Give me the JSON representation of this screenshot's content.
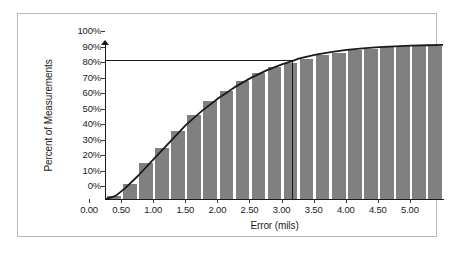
{
  "figure": {
    "background": "#ffffff",
    "frame_color": "#b9b9b9",
    "bar_color": "#808080",
    "curve_color": "#1a1a1a"
  },
  "chart_data": {
    "type": "bar",
    "title": "",
    "subtitle": "",
    "xlabel": "Error (mils)",
    "ylabel": "Percent of Measurements",
    "xlim": [
      0.0,
      5.25
    ],
    "ylim": [
      0,
      100
    ],
    "grid": false,
    "legend": "none",
    "x_tick_labels": [
      "0.00",
      "0.50",
      "1.00",
      "1.50",
      "2.00",
      "2.50",
      "3.00",
      "3.50",
      "4.00",
      "4.50",
      "5.00"
    ],
    "x_tick_values": [
      0.0,
      0.5,
      1.0,
      1.5,
      2.0,
      2.5,
      3.0,
      3.5,
      4.0,
      4.5,
      5.0
    ],
    "y_tick_labels": [
      "0%",
      "10%",
      "20%",
      "30%",
      "40%",
      "50%",
      "60%",
      "70%",
      "80%",
      "90%",
      "100%"
    ],
    "y_tick_values": [
      0,
      10,
      20,
      30,
      40,
      50,
      60,
      70,
      80,
      90,
      100
    ],
    "bar_width_mils": 0.25,
    "categories": [
      0.0,
      0.25,
      0.5,
      0.75,
      1.0,
      1.25,
      1.5,
      1.75,
      2.0,
      2.25,
      2.5,
      2.75,
      3.0,
      3.25,
      3.5,
      3.75,
      4.0,
      4.25,
      4.5,
      4.75,
      5.0
    ],
    "values": [
      2,
      10,
      23,
      33,
      44,
      54,
      63,
      70,
      76,
      81,
      85,
      88,
      90.5,
      93,
      94.5,
      96,
      97,
      97.8,
      98.4,
      98.8,
      99
    ],
    "series": [
      {
        "name": "Cumulative percent of measurements",
        "values": [
          2,
          10,
          23,
          33,
          44,
          54,
          63,
          70,
          76,
          81,
          85,
          88,
          90.5,
          93,
          94.5,
          96,
          97,
          97.8,
          98.4,
          98.8,
          99
        ]
      },
      {
        "name": "Cumulative distribution curve",
        "type": "line",
        "x": [
          0.0,
          0.15,
          0.3,
          0.5,
          0.75,
          1.0,
          1.25,
          1.5,
          1.75,
          2.0,
          2.25,
          2.5,
          2.75,
          2.9,
          3.0,
          3.25,
          3.5,
          3.75,
          4.0,
          4.25,
          4.5,
          4.75,
          5.0,
          5.25
        ],
        "values": [
          0,
          2,
          7,
          15,
          26,
          37,
          48,
          57,
          65,
          72,
          78,
          83,
          87,
          89,
          90.5,
          93,
          94.8,
          96.2,
          97.2,
          98,
          98.5,
          98.9,
          99.2,
          99.4
        ]
      }
    ],
    "annotations": [
      {
        "name": "ninety-percent-reference-line",
        "type": "hline",
        "y": 90,
        "x_start": 0.0,
        "x_end": 2.9
      },
      {
        "name": "error-threshold-reference-line",
        "type": "vline",
        "x": 2.9,
        "y_start": 0,
        "y_end": 90
      }
    ]
  }
}
